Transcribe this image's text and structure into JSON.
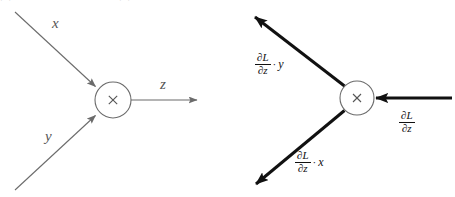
{
  "figure": {
    "type": "diagram",
    "clipped_top_caption": "图 3-1 乘法节点的计算图：正向传播和反向传播",
    "colors": {
      "forward_stroke": "#6b6b6b",
      "backward_stroke": "#111111",
      "node_stroke": "#6b6b6b",
      "text": "#2b2b2b",
      "background": "#ffffff"
    }
  },
  "forward_graph": {
    "name": "forward-pass-graph",
    "node": {
      "operator": "×",
      "cx": 113,
      "cy": 100,
      "r": 18
    },
    "edges": [
      {
        "id": "edge-x",
        "label": "x",
        "direction": "in",
        "from": "upper-left"
      },
      {
        "id": "edge-y",
        "label": "y",
        "direction": "in",
        "from": "lower-left"
      },
      {
        "id": "edge-z",
        "label": "z",
        "direction": "out",
        "to": "right"
      }
    ]
  },
  "backward_graph": {
    "name": "backward-pass-graph",
    "node": {
      "operator": "×",
      "cx": 357,
      "cy": 98,
      "r": 17
    },
    "edges": [
      {
        "id": "edge-grad-y",
        "direction": "out",
        "to": "upper-left",
        "label": {
          "numerator": "∂L",
          "denominator": "∂z",
          "operator": "·",
          "factor": "y"
        }
      },
      {
        "id": "edge-grad-x",
        "direction": "out",
        "to": "lower-left",
        "label": {
          "numerator": "∂L",
          "denominator": "∂z",
          "operator": "·",
          "factor": "x"
        }
      },
      {
        "id": "edge-grad-z",
        "direction": "in",
        "from": "right",
        "label": {
          "numerator": "∂L",
          "denominator": "∂z",
          "operator": "",
          "factor": ""
        }
      }
    ]
  }
}
